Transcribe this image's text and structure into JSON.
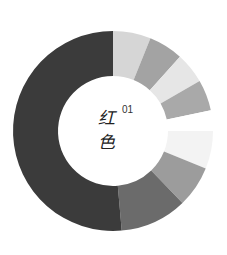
{
  "chart_data": {
    "type": "pie",
    "variant": "donut",
    "title": "",
    "center_label": {
      "line1": "红",
      "line2": "色",
      "superscript": "01"
    },
    "start_angle_deg": 0,
    "direction": "clockwise",
    "segments": [
      {
        "start": 0,
        "end": 22,
        "color": "#d6d6d6"
      },
      {
        "start": 22,
        "end": 42,
        "color": "#a3a3a3"
      },
      {
        "start": 42,
        "end": 60,
        "color": "#e6e6e6"
      },
      {
        "start": 60,
        "end": 78,
        "color": "#a9a9a9"
      },
      {
        "start": 78,
        "end": 90,
        "color": "#ffffff"
      },
      {
        "start": 90,
        "end": 112,
        "color": "#f3f3f3"
      },
      {
        "start": 112,
        "end": 136,
        "color": "#9c9c9c"
      },
      {
        "start": 136,
        "end": 175,
        "color": "#6b6b6b"
      },
      {
        "start": 175,
        "end": 360,
        "color": "#3b3b3b"
      }
    ],
    "geometry": {
      "cx": 113,
      "cy": 131,
      "outer_r": 100,
      "inner_r": 55
    },
    "legend": null,
    "grid": false
  },
  "labels": {
    "line1": "红",
    "line2": "色",
    "superscript": "01"
  }
}
